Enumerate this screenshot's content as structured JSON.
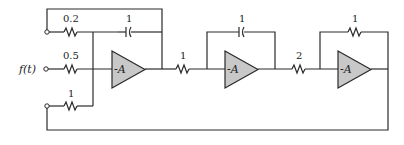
{
  "diagram": {
    "type": "analog-computer-circuit",
    "input_label": "f(t)",
    "amplifiers": [
      {
        "id": "amp1",
        "label": "-A"
      },
      {
        "id": "amp2",
        "label": "-A"
      },
      {
        "id": "amp3",
        "label": "-A"
      }
    ],
    "components": {
      "r_top_input": {
        "type": "resistor",
        "value": "0.2"
      },
      "r_f_input": {
        "type": "resistor",
        "value": "0.5"
      },
      "r_bottom_input": {
        "type": "resistor",
        "value": "1"
      },
      "c_amp1_feedback": {
        "type": "capacitor",
        "value": "1"
      },
      "r_amp1_to_amp2": {
        "type": "resistor",
        "value": "1"
      },
      "c_amp2_feedback": {
        "type": "capacitor",
        "value": "1"
      },
      "r_amp2_to_amp3": {
        "type": "resistor",
        "value": "2"
      },
      "r_amp3_feedback": {
        "type": "resistor",
        "value": "1"
      }
    },
    "colors": {
      "wire": "#2a2a2a",
      "amplifier_fill": "#c8c8c8",
      "background": "#ffffff"
    }
  }
}
